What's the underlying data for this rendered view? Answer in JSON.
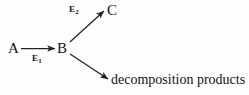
{
  "diagram": {
    "background_color": "#fdfdfd",
    "stroke_color": "#222222",
    "nodes": {
      "reactant": "A",
      "intermediate": "B",
      "product": "C",
      "byproduct": "decomposition products"
    },
    "rate_labels": {
      "step1_letter": "E",
      "step1_subscript": "1",
      "step2_letter": "E",
      "step2_subscript": "2"
    },
    "arrows": [
      {
        "name": "a-to-b",
        "from": "A",
        "to": "B",
        "label": "E1",
        "direction": "right"
      },
      {
        "name": "b-to-c",
        "from": "B",
        "to": "C",
        "label": "E2",
        "direction": "up-right"
      },
      {
        "name": "b-to-decomposition",
        "from": "B",
        "to": "decomposition products",
        "label": "",
        "direction": "down-right"
      }
    ]
  }
}
